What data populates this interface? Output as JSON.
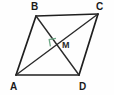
{
  "figure": {
    "kind": "geometry-diagram",
    "shape_name": "rhombus",
    "canvas": {
      "width": 114,
      "height": 95,
      "background": "#fefefe"
    },
    "style": {
      "side_color": "#1f1f1f",
      "diagonal_color": "#2b2b2b",
      "right_angle_color": "#6fa887",
      "side_width": 1.6,
      "diagonal_width": 1.4,
      "right_angle_width": 1.2
    },
    "vertices": [
      {
        "id": "B",
        "label": "B",
        "x": 36,
        "y": 16,
        "label_x": 31,
        "label_y": 2
      },
      {
        "id": "C",
        "label": "C",
        "x": 98,
        "y": 14,
        "label_x": 96,
        "label_y": 2
      },
      {
        "id": "D",
        "label": "D",
        "x": 79,
        "y": 75,
        "label_x": 79,
        "label_y": 82
      },
      {
        "id": "A",
        "label": "A",
        "x": 16,
        "y": 75,
        "label_x": 10,
        "label_y": 82
      }
    ],
    "sides": [
      {
        "from": "B",
        "to": "C",
        "name": "side-bc"
      },
      {
        "from": "C",
        "to": "D",
        "name": "side-cd"
      },
      {
        "from": "D",
        "to": "A",
        "name": "side-da"
      },
      {
        "from": "A",
        "to": "B",
        "name": "side-ab"
      }
    ],
    "diagonals": [
      {
        "from": "A",
        "to": "C",
        "name": "diagonal-ac"
      },
      {
        "from": "B",
        "to": "D",
        "name": "diagonal-bd"
      }
    ],
    "intersection": {
      "id": "M",
      "label": "M",
      "x": 58.5,
      "y": 44.5,
      "label_x": 62,
      "label_y": 41
    },
    "right_angle_mark": {
      "label": "right-angle",
      "points": "56.0,38.4 49.2,39.6 50.4,46.4"
    }
  }
}
